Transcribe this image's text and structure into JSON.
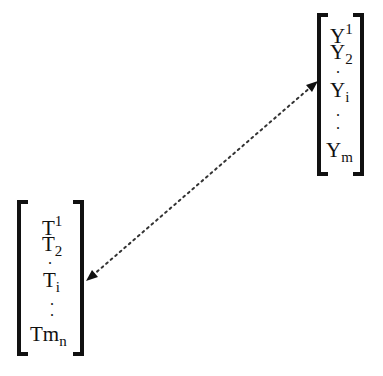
{
  "vector_y": {
    "items": [
      {
        "base": "Y",
        "sup": "1",
        "sub": ""
      },
      {
        "base": "Y",
        "sup": "",
        "sub": "2"
      },
      {
        "base": "Y",
        "sup": "",
        "sub": "i"
      },
      {
        "base": "Y",
        "sup": "",
        "sub": "m"
      }
    ],
    "ellipsis": "."
  },
  "vector_t": {
    "items": [
      {
        "base": "T",
        "sup": "1",
        "sub": ""
      },
      {
        "base": "T",
        "sup": "",
        "sub": "2"
      },
      {
        "base": "T",
        "sup": "",
        "sub": "i"
      },
      {
        "base": "Tm",
        "sup": "",
        "sub": "n"
      }
    ],
    "ellipsis": "."
  },
  "connector": {
    "style": "dotted",
    "direction": "bidirectional",
    "color": "#333333"
  }
}
